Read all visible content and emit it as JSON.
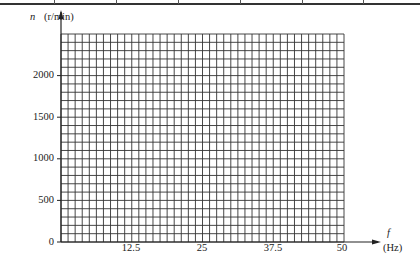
{
  "chart_data": {
    "type": "line",
    "title": "",
    "xlabel": "f",
    "xunit": "(Hz)",
    "ylabel": "n",
    "yunit": "(r/min)",
    "x_ticks": [
      "12.5",
      "25",
      "37.5",
      "50"
    ],
    "x_tick_values": [
      12.5,
      25,
      37.5,
      50
    ],
    "y_ticks": [
      "0",
      "500",
      "1000",
      "1500",
      "2000"
    ],
    "y_tick_values": [
      0,
      500,
      1000,
      1500,
      2000
    ],
    "xlim": [
      0,
      50
    ],
    "ylim": [
      0,
      2500
    ],
    "grid": true,
    "grid_columns": 40,
    "grid_rows": 25,
    "series": []
  },
  "axes": {
    "y_name": "n",
    "y_unit": "(r/min)",
    "x_name": "f",
    "x_unit": "(Hz)",
    "origin": "0",
    "y_labels": [
      "500",
      "1000",
      "1500",
      "2000"
    ],
    "x_labels": [
      "12.5",
      "25",
      "37.5",
      "50"
    ]
  },
  "colors": {
    "grid": "#333333",
    "axis": "#222222",
    "background": "#ffffff"
  }
}
